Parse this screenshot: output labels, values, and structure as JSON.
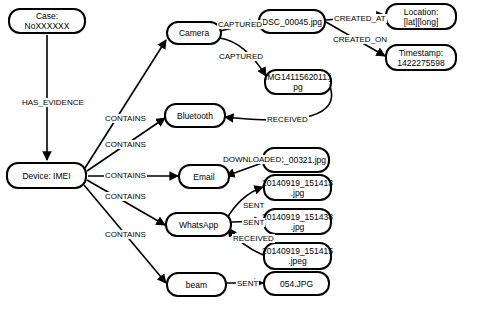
{
  "diagram": {
    "type": "evidence-graph",
    "nodes": [
      {
        "id": "case",
        "label": "Case: NoXXXXXX"
      },
      {
        "id": "device",
        "label": "Device: IMEI"
      },
      {
        "id": "camera",
        "label": "Camera"
      },
      {
        "id": "bluetooth",
        "label": "Bluetooth"
      },
      {
        "id": "email",
        "label": "Email"
      },
      {
        "id": "whatsapp",
        "label": "WhatsApp"
      },
      {
        "id": "beam",
        "label": "beam"
      },
      {
        "id": "dsc45",
        "label": "DSC_00045.jpg"
      },
      {
        "id": "img1411",
        "label": "IMG1411562011.j\npg"
      },
      {
        "id": "location",
        "label": "Location:\n[lat][long]"
      },
      {
        "id": "timestamp",
        "label": "Timestamp:\n1422275598"
      },
      {
        "id": "dsc321",
        "label": "DSC_00321.jpg"
      },
      {
        "id": "wa1",
        "label": "20140919_151413\n.jpg"
      },
      {
        "id": "wa2",
        "label": "20140919_151438\n.jpg"
      },
      {
        "id": "wa3",
        "label": "20140919_151415\n.jpeg"
      },
      {
        "id": "jpg054",
        "label": "054.JPG"
      }
    ],
    "edges": [
      {
        "from": "case",
        "to": "device",
        "label": "HAS_EVIDENCE"
      },
      {
        "from": "device",
        "to": "camera",
        "label": "CONTAINS"
      },
      {
        "from": "device",
        "to": "bluetooth",
        "label": "CONTAINS"
      },
      {
        "from": "device",
        "to": "email",
        "label": "CONTAINS"
      },
      {
        "from": "device",
        "to": "whatsapp",
        "label": "CONTAINS"
      },
      {
        "from": "device",
        "to": "beam",
        "label": "CONTAINS"
      },
      {
        "from": "camera",
        "to": "dsc45",
        "label": "CAPTURED"
      },
      {
        "from": "camera",
        "to": "img1411",
        "label": "CAPTURED"
      },
      {
        "from": "dsc45",
        "to": "location",
        "label": "CREATED_AT"
      },
      {
        "from": "dsc45",
        "to": "timestamp",
        "label": "CREATED_ON"
      },
      {
        "from": "img1411",
        "to": "bluetooth",
        "label": "RECEIVED"
      },
      {
        "from": "dsc321",
        "to": "email",
        "label": "DOWNLOADED"
      },
      {
        "from": "whatsapp",
        "to": "wa1",
        "label": "SENT"
      },
      {
        "from": "whatsapp",
        "to": "wa2",
        "label": "SENT"
      },
      {
        "from": "wa3",
        "to": "whatsapp",
        "label": "RECEIVED"
      },
      {
        "from": "beam",
        "to": "jpg054",
        "label": "SENT"
      }
    ]
  },
  "colors": {
    "stroke": "#000000",
    "fill": "#ffffff",
    "text": "#000000"
  }
}
